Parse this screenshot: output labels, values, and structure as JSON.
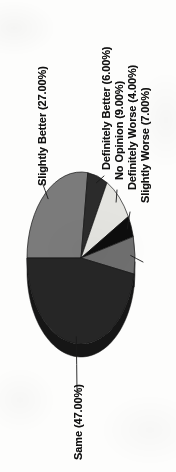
{
  "chart_data": {
    "type": "pie",
    "title": "",
    "subtitle": "",
    "xlabel": "",
    "ylabel": "",
    "grid": false,
    "legend_position": "none",
    "label_format": "{name} ({pct}%)",
    "rotation_degrees": -90,
    "three_d": true,
    "categories": [
      "Slightly Better",
      "Definitely Better",
      "No Opinion",
      "Definitely Worse",
      "Slightly Worse",
      "Same"
    ],
    "values": [
      27.0,
      6.0,
      9.0,
      4.0,
      7.0,
      47.0
    ],
    "total": 100.0,
    "slices": [
      {
        "name": "Slightly Better",
        "value": 27.0,
        "label": "Slightly Better (27.00%)",
        "color": "#7b7b7b",
        "side_color": "#5d5d5d"
      },
      {
        "name": "Definitely Better",
        "value": 6.0,
        "label": "Definitely Better (6.00%)",
        "color": "#2b2b2b",
        "side_color": "#1c1c1c"
      },
      {
        "name": "No Opinion",
        "value": 9.0,
        "label": "No Opinion (9.00%)",
        "color": "#e4e4e0",
        "side_color": "#b3b3ae"
      },
      {
        "name": "Definitely Worse",
        "value": 4.0,
        "label": "Definitely Worse (4.00%)",
        "color": "#0d0d0d",
        "side_color": "#070707"
      },
      {
        "name": "Slightly Worse",
        "value": 7.0,
        "label": "Slightly Worse (7.00%)",
        "color": "#6f6f6f",
        "side_color": "#525252"
      },
      {
        "name": "Same",
        "value": 47.0,
        "label": "Same (47.00%)",
        "color": "#262626",
        "side_color": "#161616"
      }
    ],
    "leader_line_color": "#1a1a1a",
    "background_color": "#fdfdfc"
  }
}
